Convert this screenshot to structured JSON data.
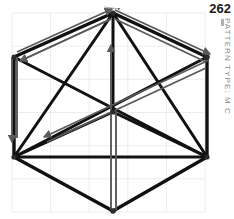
{
  "plate": {
    "number": "262",
    "label": "PATTERN TYPE: M C"
  },
  "colors": {
    "line_black": "#111111",
    "arrow_gray": "#5a5a5a",
    "grid": "#ececec",
    "label_gray": "#8c8c8c",
    "number_black": "#1a1a1a",
    "background": "#ffffff"
  },
  "diagram": {
    "type": "hexagonal-lattice-pattern",
    "grid": {
      "visible": true,
      "x_start": 12,
      "x_end": 205,
      "columns": 5,
      "y_start": 13,
      "y_end": 212,
      "rows": 6,
      "cell_w": 38.6,
      "cell_h": 33.2
    },
    "vertices": [
      {
        "name": "top",
        "x": 113,
        "y": 13
      },
      {
        "name": "upper-right",
        "x": 207,
        "y": 57
      },
      {
        "name": "lower-right",
        "x": 207,
        "y": 157
      },
      {
        "name": "bottom",
        "x": 113,
        "y": 211
      },
      {
        "name": "lower-left",
        "x": 14,
        "y": 157
      },
      {
        "name": "upper-left",
        "x": 14,
        "y": 57
      },
      {
        "name": "center",
        "x": 113,
        "y": 112
      }
    ],
    "black_edges": [
      {
        "from": "top",
        "to": "upper-right"
      },
      {
        "from": "upper-right",
        "to": "lower-right"
      },
      {
        "from": "lower-right",
        "to": "bottom"
      },
      {
        "from": "bottom",
        "to": "lower-left"
      },
      {
        "from": "lower-left",
        "to": "upper-left"
      },
      {
        "from": "upper-left",
        "to": "top"
      }
    ],
    "black_chords": [
      {
        "from": "top",
        "to": "lower-left"
      },
      {
        "from": "top",
        "to": "lower-right"
      },
      {
        "from": "top",
        "to": "center"
      },
      {
        "from": "upper-left",
        "to": "lower-right"
      },
      {
        "from": "upper-right",
        "to": "lower-left"
      },
      {
        "from": "lower-left",
        "to": "lower-right"
      },
      {
        "from": "lower-left",
        "to": "center"
      },
      {
        "from": "lower-right",
        "to": "center"
      },
      {
        "from": "lower-left",
        "to": "bottom"
      },
      {
        "from": "lower-right",
        "to": "bottom"
      }
    ],
    "gray_arrows": [
      {
        "name": "arrow-top-left-to-top",
        "from": "upper-left",
        "to": "top",
        "direction": "up-right",
        "head_at": "end"
      },
      {
        "name": "arrow-top-to-upper-left",
        "from": "top",
        "to": "upper-left",
        "direction": "down-left",
        "head_at": "end"
      },
      {
        "name": "arrow-top-to-upper-right",
        "from": "top",
        "to": "upper-right",
        "direction": "down-right",
        "head_at": "end"
      },
      {
        "name": "arrow-upper-right-to-center",
        "from": "upper-right",
        "to": "center",
        "direction": "down-left",
        "head_at": "end"
      },
      {
        "name": "arrow-center-to-lower-left",
        "from": "center",
        "to": "lower-left",
        "direction": "down-left",
        "head_at": "end"
      },
      {
        "name": "arrow-vertical-center-up",
        "from": "bottom",
        "to": "center",
        "direction": "up",
        "head_at": "end"
      },
      {
        "name": "arrow-vertical-left-down",
        "from": "upper-left",
        "to": "lower-left",
        "direction": "down",
        "head_at": "end"
      }
    ],
    "node_dots": [
      "top",
      "upper-right",
      "lower-right",
      "bottom",
      "lower-left",
      "upper-left",
      "center"
    ]
  }
}
